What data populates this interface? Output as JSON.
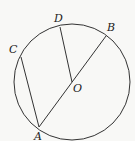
{
  "diagram": {
    "type": "circle-geometry",
    "stroke_color": "#333333",
    "background": "#f8f8f6",
    "circle": {
      "name": "circle",
      "cx": 72,
      "cy": 82,
      "r": 58
    },
    "points": {
      "A": {
        "label": "A",
        "x": 39,
        "y": 127,
        "label_x": 34,
        "label_y": 140
      },
      "B": {
        "label": "B",
        "x": 106,
        "y": 36,
        "label_x": 107,
        "label_y": 31
      },
      "C": {
        "label": "C",
        "x": 21,
        "y": 57,
        "label_x": 9,
        "label_y": 53
      },
      "D": {
        "label": "D",
        "x": 60,
        "y": 27,
        "label_x": 54,
        "label_y": 22
      },
      "O": {
        "label": "O",
        "x": 72,
        "y": 82,
        "label_x": 73,
        "label_y": 92
      }
    },
    "segments": [
      {
        "name": "diameter-AB",
        "from": "A",
        "to": "B"
      },
      {
        "name": "chord-AC",
        "from": "A",
        "to": "C"
      },
      {
        "name": "radius-OD",
        "from": "O",
        "to": "D"
      }
    ]
  }
}
